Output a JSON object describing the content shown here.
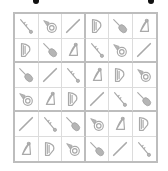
{
  "puzzle": {
    "type": "6x6 instrument sudoku",
    "box_size": {
      "cols": 3,
      "rows": 2
    },
    "symbols": [
      "clarinet",
      "horn",
      "flute",
      "harp",
      "violin",
      "lyre"
    ],
    "rows": [
      [
        "clarinet",
        "horn",
        "flute",
        "harp",
        "violin",
        "lyre"
      ],
      [
        "harp",
        "violin",
        "lyre",
        "clarinet",
        "horn",
        "flute"
      ],
      [
        "violin",
        "flute",
        "clarinet",
        "lyre",
        "harp",
        "horn"
      ],
      [
        "horn",
        "lyre",
        "harp",
        "flute",
        "clarinet",
        "violin"
      ],
      [
        "flute",
        "clarinet",
        "violin",
        "horn",
        "lyre",
        "harp"
      ],
      [
        "lyre",
        "harp",
        "horn",
        "violin",
        "flute",
        "clarinet"
      ]
    ]
  },
  "colors": {
    "grid_border": "#bdbdbd",
    "cell_line": "#dcdcdc",
    "icon": "#a9a9a9"
  }
}
